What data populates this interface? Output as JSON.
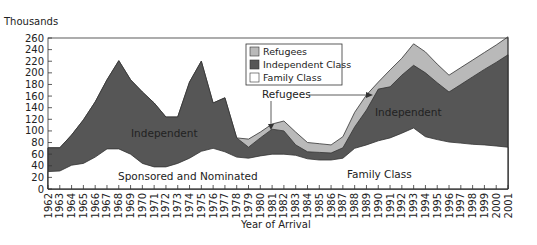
{
  "chart_data": {
    "type": "area",
    "stacked": true,
    "title": "",
    "ylabel": "Thousands",
    "xlabel": "Year of Arrival",
    "ylim": [
      0,
      260
    ],
    "yticks": [
      0,
      20,
      40,
      60,
      80,
      100,
      120,
      140,
      160,
      180,
      200,
      220,
      240,
      260
    ],
    "grid": false,
    "legend_position": "top-center (inside plot)",
    "x": [
      1962,
      1963,
      1964,
      1965,
      1966,
      1967,
      1968,
      1969,
      1970,
      1971,
      1972,
      1973,
      1974,
      1975,
      1976,
      1977,
      1978,
      1979,
      1980,
      1981,
      1982,
      1983,
      1984,
      1985,
      1986,
      1987,
      1988,
      1989,
      1990,
      1991,
      1992,
      1993,
      1994,
      1995,
      1996,
      1997,
      1998,
      1999,
      2000,
      2001
    ],
    "cumulative_series": [
      {
        "name": "Family Class",
        "color": "#ffffff",
        "values": [
          30,
          31,
          41,
          44,
          55,
          69,
          69,
          60,
          44,
          38,
          38,
          44,
          53,
          65,
          70,
          64,
          55,
          53,
          57,
          60,
          60,
          58,
          52,
          50,
          50,
          53,
          70,
          76,
          83,
          88,
          96,
          105,
          90,
          85,
          81,
          79,
          77,
          76,
          74,
          72
        ]
      },
      {
        "name": "Independent Class",
        "color": "#565656",
        "values": [
          71,
          71,
          93,
          119,
          150,
          188,
          221,
          188,
          167,
          148,
          124,
          124,
          184,
          220,
          148,
          157,
          88,
          72,
          88,
          103,
          100,
          76,
          64,
          63,
          62,
          71,
          107,
          136,
          172,
          176,
          196,
          213,
          200,
          183,
          167,
          180,
          193,
          206,
          218,
          231
        ]
      },
      {
        "name": "Refugees",
        "color": "#b9b9b9",
        "values": [
          71,
          71,
          93,
          119,
          150,
          188,
          221,
          188,
          167,
          148,
          124,
          124,
          184,
          220,
          148,
          157,
          88,
          86,
          98,
          112,
          117,
          98,
          80,
          78,
          76,
          90,
          132,
          162,
          184,
          205,
          225,
          250,
          236,
          215,
          196,
          209,
          222,
          235,
          248,
          262
        ]
      }
    ],
    "series": [
      {
        "name": "Family Class",
        "values": [
          30,
          31,
          41,
          44,
          55,
          69,
          69,
          60,
          44,
          38,
          38,
          44,
          53,
          65,
          70,
          64,
          55,
          53,
          57,
          60,
          60,
          58,
          52,
          50,
          50,
          53,
          70,
          76,
          83,
          88,
          96,
          105,
          90,
          85,
          81,
          79,
          77,
          76,
          74,
          72
        ]
      },
      {
        "name": "Independent Class",
        "values": [
          41,
          40,
          52,
          75,
          95,
          119,
          152,
          128,
          123,
          110,
          86,
          80,
          131,
          155,
          78,
          93,
          33,
          19,
          31,
          43,
          40,
          18,
          12,
          13,
          12,
          18,
          37,
          60,
          89,
          88,
          100,
          108,
          110,
          98,
          86,
          101,
          116,
          130,
          144,
          159
        ]
      },
      {
        "name": "Refugees",
        "values": [
          0,
          0,
          0,
          0,
          0,
          0,
          0,
          0,
          0,
          0,
          0,
          0,
          0,
          0,
          0,
          0,
          0,
          14,
          10,
          9,
          17,
          22,
          16,
          15,
          14,
          19,
          25,
          26,
          12,
          29,
          29,
          37,
          36,
          32,
          29,
          29,
          29,
          29,
          30,
          31
        ]
      }
    ],
    "annotations": [
      {
        "text": "Independent",
        "near": 1969,
        "region": "Independent Class (early period)"
      },
      {
        "text": "Sponsored and Nominated",
        "near": 1970,
        "region": "Family Class (early period)"
      },
      {
        "text": "Refugees",
        "near": 1981,
        "region": "Refugees band, arrows to 1981 and 1990"
      },
      {
        "text": "Independent",
        "near": 1991,
        "region": "Independent Class (late period)"
      },
      {
        "text": "Family Class",
        "near": 1989,
        "region": "Family Class (late period)"
      }
    ]
  },
  "labels": {
    "y_unit": "Thousands",
    "x_title": "Year of Arrival",
    "legend": [
      "Refugees",
      "Independent Class",
      "Family Class"
    ],
    "annot_independent_left": "Independent",
    "annot_sponsored": "Sponsored and Nominated",
    "annot_refugees": "Refugees",
    "annot_independent_right": "Independent",
    "annot_family": "Family Class"
  },
  "colors": {
    "refugees": "#b9b9b9",
    "independent": "#565656",
    "family": "#ffffff",
    "outline": "#333333"
  }
}
